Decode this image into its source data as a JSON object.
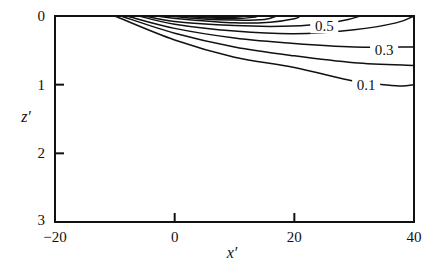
{
  "chart_data": {
    "type": "contour",
    "title": "",
    "xlabel": "x′",
    "ylabel": "z′",
    "xlim": [
      -20,
      40
    ],
    "ylim": [
      3,
      0
    ],
    "y_inverted": true,
    "grid": false,
    "x_ticks": [
      "-20",
      "0",
      "20",
      "40"
    ],
    "y_ticks": [
      "0",
      "1",
      "2",
      "3"
    ],
    "x_tick_labels": [
      "−20",
      "0",
      "20",
      "40"
    ],
    "contour_labels": [
      {
        "text": "0.5",
        "x": 25,
        "z": 0.15
      },
      {
        "text": "0.3",
        "x": 35,
        "z": 0.5
      },
      {
        "text": "0.1",
        "x": 32,
        "z": 1.0
      }
    ],
    "contours": [
      {
        "level": "0.1",
        "points": [
          [
            -10,
            0
          ],
          [
            0,
            0.35
          ],
          [
            10,
            0.6
          ],
          [
            20,
            0.75
          ],
          [
            30,
            0.95
          ],
          [
            35,
            1.0
          ],
          [
            38,
            1.02
          ],
          [
            40,
            1.0
          ]
        ]
      },
      {
        "level": "0.2",
        "points": [
          [
            -9,
            0
          ],
          [
            0,
            0.25
          ],
          [
            10,
            0.45
          ],
          [
            20,
            0.58
          ],
          [
            30,
            0.68
          ],
          [
            40,
            0.72
          ]
        ]
      },
      {
        "level": "0.3",
        "points": [
          [
            -8,
            0
          ],
          [
            0,
            0.18
          ],
          [
            10,
            0.32
          ],
          [
            20,
            0.4
          ],
          [
            30,
            0.45
          ],
          [
            40,
            0.45
          ]
        ]
      },
      {
        "level": "0.4",
        "points": [
          [
            -6,
            0
          ],
          [
            0,
            0.12
          ],
          [
            10,
            0.22
          ],
          [
            20,
            0.26
          ],
          [
            30,
            0.2
          ],
          [
            37,
            0.1
          ],
          [
            40,
            0.0
          ]
        ]
      },
      {
        "level": "0.5",
        "points": [
          [
            -5,
            0
          ],
          [
            0,
            0.08
          ],
          [
            10,
            0.14
          ],
          [
            18,
            0.15
          ],
          [
            24,
            0.12
          ],
          [
            29,
            0.05
          ],
          [
            31,
            0.0
          ]
        ]
      },
      {
        "level": "0.6",
        "points": [
          [
            -3,
            0
          ],
          [
            2,
            0.05
          ],
          [
            10,
            0.1
          ],
          [
            16,
            0.09
          ],
          [
            20,
            0.04
          ],
          [
            21,
            0.0
          ]
        ]
      },
      {
        "level": "0.7",
        "points": [
          [
            -1,
            0
          ],
          [
            4,
            0.04
          ],
          [
            10,
            0.06
          ],
          [
            15,
            0.05
          ],
          [
            17,
            0.0
          ]
        ]
      },
      {
        "level": "0.8",
        "points": [
          [
            1,
            0
          ],
          [
            6,
            0.03
          ],
          [
            10,
            0.04
          ],
          [
            13,
            0.02
          ],
          [
            14,
            0.0
          ]
        ]
      },
      {
        "level": "0.9",
        "points": [
          [
            3,
            0
          ],
          [
            7,
            0.02
          ],
          [
            10,
            0.02
          ],
          [
            12,
            0.0
          ]
        ]
      }
    ]
  },
  "plot_box": {
    "left": 55,
    "right": 414,
    "top": 16,
    "bottom": 222
  }
}
